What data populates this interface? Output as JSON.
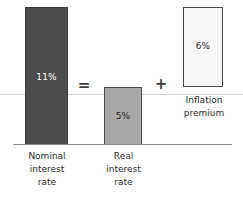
{
  "chart_data": {
    "type": "bar",
    "title": "",
    "subtitle": "",
    "xlabel": "",
    "ylabel": "",
    "grid": false,
    "legend_position": "none",
    "ylim": [
      0,
      11
    ],
    "categories": [
      "Nominal interest rate",
      "Real interest rate",
      "Inflation premium"
    ],
    "values": [
      11,
      5,
      6
    ],
    "value_labels": [
      "11%",
      "5%",
      "6%"
    ],
    "annotations": [
      "=",
      "+"
    ],
    "relationship": "Nominal interest rate = Real interest rate + Inflation premium",
    "series": [
      {
        "name": "Interest rate decomposition",
        "values": [
          11,
          5,
          6
        ],
        "units": "percent"
      }
    ]
  },
  "bars": [
    {
      "id": "nominal",
      "value_label": "11%",
      "caption_lines": [
        "Nominal",
        "interest",
        "rate"
      ],
      "fill": "#4d4d4d",
      "text_color": "#ffffff"
    },
    {
      "id": "real",
      "value_label": "5%",
      "caption_lines": [
        "Real",
        "interest",
        "rate"
      ],
      "fill": "#a8a8a8",
      "text_color": "#2b2b2b"
    },
    {
      "id": "inflation",
      "value_label": "6%",
      "caption_lines": [
        "Inflation",
        "premium"
      ],
      "fill": "#f7f7f7",
      "text_color": "#2b2b2b"
    }
  ],
  "operators": {
    "equals": "=",
    "plus": "+"
  },
  "colors": {
    "nominal_bar": "#4d4d4d",
    "real_bar": "#a8a8a8",
    "inflation_box": "#f7f7f7",
    "bar_outline": "#4a4a4a",
    "baseline": "#8a8a8a",
    "zero_line": "#d3d3d3",
    "background": "#ffffff",
    "caption_text": "#2e2e2e"
  }
}
